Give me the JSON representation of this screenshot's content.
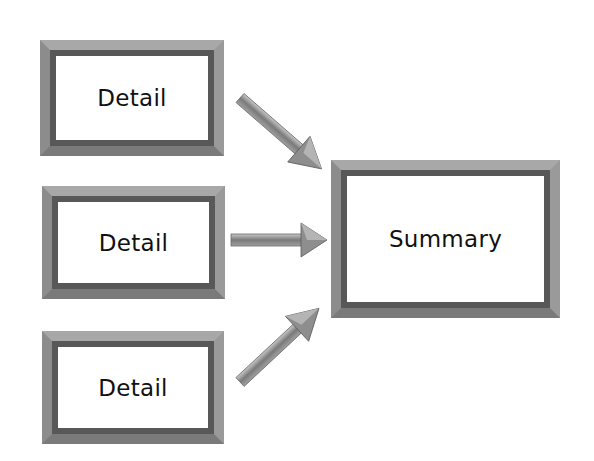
{
  "diagram": {
    "type": "fan-in flow",
    "details": [
      {
        "label": "Detail"
      },
      {
        "label": "Detail"
      },
      {
        "label": "Detail"
      }
    ],
    "summary": {
      "label": "Summary"
    },
    "edges": [
      {
        "from": "details.0",
        "to": "summary"
      },
      {
        "from": "details.1",
        "to": "summary"
      },
      {
        "from": "details.2",
        "to": "summary"
      }
    ],
    "colors": {
      "frame_outer": "#a8a8a8",
      "frame_inner": "#585858",
      "arrow": "#8a8a8a",
      "background": "#ffffff"
    }
  }
}
